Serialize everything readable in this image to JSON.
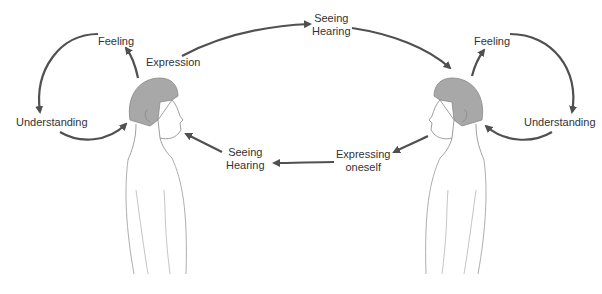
{
  "diagram": {
    "left_person": {
      "loop_labels": {
        "top": "Feeling",
        "left": "Understanding"
      },
      "output_label": "Expression"
    },
    "right_person": {
      "loop_labels": {
        "top": "Feeling",
        "right": "Understanding"
      },
      "output_label": [
        "Expressing",
        "oneself"
      ]
    },
    "top_channel_label": [
      "Seeing",
      "Hearing"
    ],
    "bottom_channel_label": [
      "Seeing",
      "Hearing"
    ],
    "colors": {
      "arrow": "#505050",
      "hair": "#a8a8a8",
      "outline": "#888888",
      "text": "#333333"
    }
  }
}
